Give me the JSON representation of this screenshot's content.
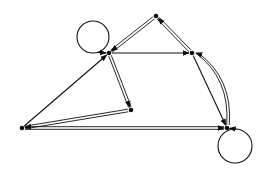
{
  "diagram": {
    "type": "directed-graph",
    "background": "#ffffff",
    "stroke_color": "#111111",
    "nodes": [
      {
        "id": "A",
        "x": 109,
        "y": 53
      },
      {
        "id": "B",
        "x": 156,
        "y": 16
      },
      {
        "id": "C",
        "x": 192,
        "y": 53
      },
      {
        "id": "D",
        "x": 131,
        "y": 110
      },
      {
        "id": "E",
        "x": 22,
        "y": 128
      },
      {
        "id": "F",
        "x": 227,
        "y": 128
      }
    ],
    "loops": [
      {
        "node": "A",
        "cx": 93,
        "cy": 37,
        "r": 16
      },
      {
        "node": "F",
        "cx": 235,
        "cy": 146,
        "r": 17
      }
    ],
    "edges": [
      {
        "from": "E",
        "to": "A",
        "style": "single"
      },
      {
        "from": "B",
        "to": "A",
        "style": "double"
      },
      {
        "from": "A",
        "to": "C",
        "style": "single"
      },
      {
        "from": "A",
        "to": "D",
        "style": "double"
      },
      {
        "from": "D",
        "to": "E",
        "style": "double"
      },
      {
        "from": "E",
        "to": "F",
        "style": "double"
      },
      {
        "from": "C",
        "to": "B",
        "style": "double"
      },
      {
        "from": "C",
        "to": "F",
        "style": "single"
      },
      {
        "from": "F",
        "to": "C",
        "style": "double-curved"
      }
    ]
  }
}
